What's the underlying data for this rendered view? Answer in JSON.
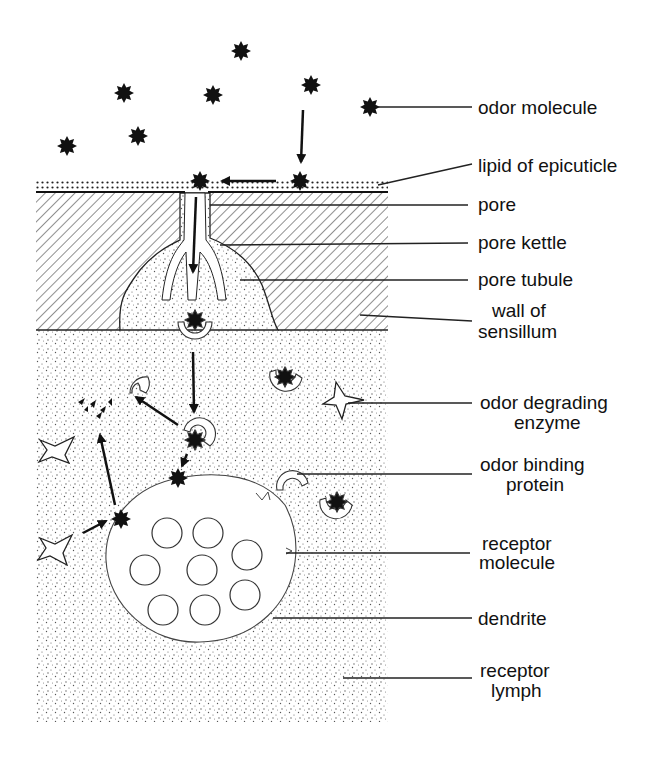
{
  "diagram": {
    "labels": [
      {
        "id": "odor-molecule",
        "lines": [
          "odor molecule"
        ]
      },
      {
        "id": "lipid-of-epicuticle",
        "lines": [
          "lipid of epicuticle"
        ]
      },
      {
        "id": "pore",
        "lines": [
          "pore"
        ]
      },
      {
        "id": "pore-kettle",
        "lines": [
          "pore kettle"
        ]
      },
      {
        "id": "pore-tubule",
        "lines": [
          "pore tubule"
        ]
      },
      {
        "id": "wall-of-sensillum",
        "lines": [
          "wall of",
          "sensillum"
        ]
      },
      {
        "id": "odor-degrading-enzyme",
        "lines": [
          "odor degrading",
          "enzyme"
        ]
      },
      {
        "id": "odor-binding-protein",
        "lines": [
          "odor binding",
          "protein"
        ]
      },
      {
        "id": "receptor-molecule",
        "lines": [
          "receptor",
          "molecule"
        ]
      },
      {
        "id": "dendrite",
        "lines": [
          "dendrite"
        ]
      },
      {
        "id": "receptor-lymph",
        "lines": [
          "receptor",
          "lymph"
        ]
      }
    ],
    "colors": {
      "ink": "#111111",
      "background": "#ffffff"
    }
  }
}
